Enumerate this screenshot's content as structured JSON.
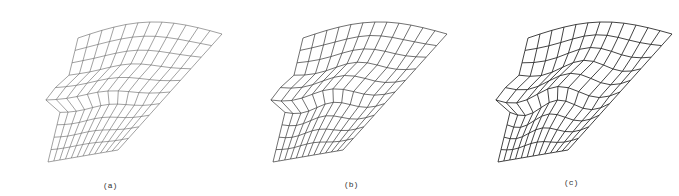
{
  "figure": {
    "panels": [
      {
        "label": "(a)",
        "offset_x": 0,
        "caption_x": 103,
        "caption_y": 181,
        "wave": 0.25,
        "stroke": "#555555",
        "stroke_width": 0.55
      },
      {
        "label": "(b)",
        "offset_x": 225,
        "caption_x": 344,
        "caption_y": 180,
        "wave": 0.6,
        "stroke": "#333333",
        "stroke_width": 0.7
      },
      {
        "label": "(c)",
        "offset_x": 450,
        "caption_x": 564,
        "caption_y": 178,
        "wave": 1.0,
        "stroke": "#222222",
        "stroke_width": 0.85
      }
    ],
    "mesh": {
      "rows": 11,
      "cols": 13
    }
  }
}
